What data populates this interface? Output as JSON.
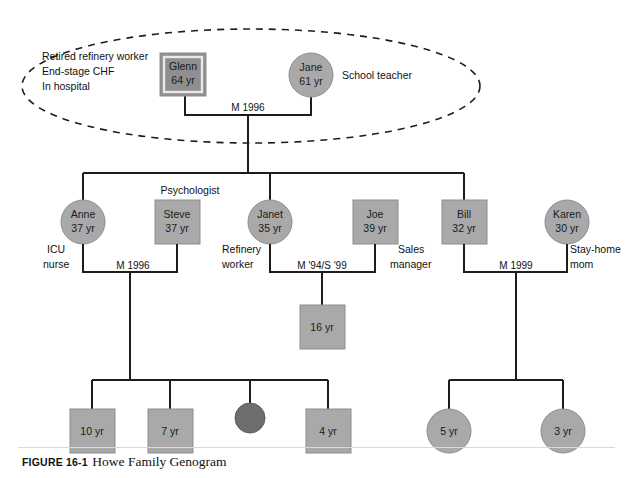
{
  "figure": {
    "number": "FIGURE 16-1",
    "title": "Howe Family Genogram"
  },
  "colors": {
    "symbol_fill": "#a9a9a9",
    "index_fill": "#8f8f8f",
    "deceased_fill": "#6e6e6e",
    "symbol_stroke": "#8d8d8d",
    "line": "#1d1d1d",
    "text": "#111111"
  },
  "household": {
    "outline": "dashed-ellipse",
    "name": "grandparent-household"
  },
  "generation1": {
    "glenn": {
      "name": "Glenn",
      "age": "64 yr",
      "shape": "square",
      "index_patient": true,
      "notes": [
        "Retired refinery worker",
        "End-stage CHF",
        "In hospital"
      ]
    },
    "jane": {
      "name": "Jane",
      "age": "61 yr",
      "shape": "circle",
      "note": "School teacher"
    },
    "relationship": "M 1996"
  },
  "generation2": {
    "anne": {
      "name": "Anne",
      "age": "37 yr",
      "shape": "circle",
      "note_line1": "ICU",
      "note_line2": "nurse"
    },
    "steve": {
      "name": "Steve",
      "age": "37 yr",
      "shape": "square",
      "note": "Psychologist"
    },
    "janet": {
      "name": "Janet",
      "age": "35 yr",
      "shape": "circle",
      "note_line1": "Refinery",
      "note_line2": "worker"
    },
    "joe": {
      "name": "Joe",
      "age": "39 yr",
      "shape": "square"
    },
    "bill": {
      "name": "Bill",
      "age": "32 yr",
      "shape": "square",
      "note_line1": "Sales",
      "note_line2": "manager"
    },
    "karen": {
      "name": "Karen",
      "age": "30 yr",
      "shape": "circle",
      "note_line1": "Stay-home",
      "note_line2": "mom"
    },
    "relationships": {
      "anne_steve": "M 1996",
      "janet_joe": "M '94/S '99",
      "bill_karen": "M 1999"
    }
  },
  "generation3": {
    "janet_joe_children": [
      {
        "age": "16 yr",
        "shape": "square"
      }
    ],
    "anne_steve_children": [
      {
        "age": "10 yr",
        "shape": "square"
      },
      {
        "age": "7 yr",
        "shape": "square"
      },
      {
        "age": "",
        "shape": "circle-filled",
        "status": "deceased"
      },
      {
        "age": "4 yr",
        "shape": "square"
      }
    ],
    "bill_karen_children": [
      {
        "age": "5 yr",
        "shape": "circle"
      },
      {
        "age": "3 yr",
        "shape": "circle"
      }
    ]
  }
}
